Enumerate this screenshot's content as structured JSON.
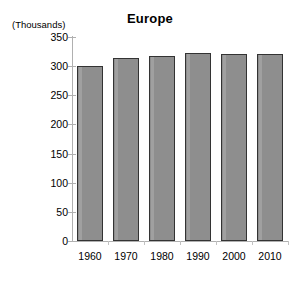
{
  "chart_data": {
    "type": "bar",
    "title": "Europe",
    "units_label": "(Thousands)",
    "categories": [
      "1960",
      "1970",
      "1980",
      "1990",
      "2000",
      "2010"
    ],
    "values": [
      300,
      314,
      317,
      323,
      320,
      321
    ],
    "series": [
      {
        "name": "Europe",
        "values": [
          300,
          314,
          317,
          323,
          320,
          321
        ]
      }
    ],
    "xlabel": "",
    "ylabel": "(Thousands)",
    "ylim": [
      0,
      350
    ],
    "yticks": [
      0,
      50,
      100,
      150,
      200,
      250,
      300,
      350
    ],
    "ytick_labels": [
      "0",
      "50",
      "100",
      "150",
      "200",
      "250",
      "300",
      "350"
    ],
    "grid": false,
    "legend": "none",
    "bar_color": "#8e8e8e",
    "bar_border_color": "#333333",
    "axis_color": "#b0b0b0",
    "background": "#ffffff",
    "text_color": "#000000"
  }
}
